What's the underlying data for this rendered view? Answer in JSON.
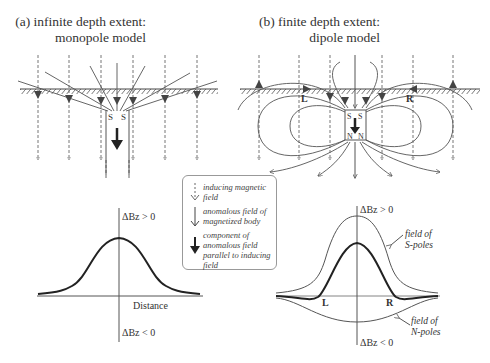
{
  "panel_a": {
    "title_line1": "(a) infinite depth extent:",
    "title_line2": "monopole model",
    "pole_labels": [
      "S",
      "S"
    ],
    "graph": {
      "y_pos_label": "ΔBz > 0",
      "y_neg_label": "ΔBz < 0",
      "x_label": "Distance"
    }
  },
  "panel_b": {
    "title_line1": "(b) finite depth extent:",
    "title_line2": "dipole model",
    "top_pole_labels": [
      "S",
      "S"
    ],
    "bottom_pole_labels": [
      "N",
      "N"
    ],
    "point_left": "L",
    "point_right": "R",
    "graph": {
      "y_pos_label": "ΔBz > 0",
      "y_neg_label": "ΔBz < 0",
      "s_field_label_1": "field of",
      "s_field_label_2": "S-poles",
      "n_field_label_1": "field of",
      "n_field_label_2": "N-poles",
      "point_left": "L",
      "point_right": "R"
    }
  },
  "legend": {
    "items": [
      {
        "icon": "dashed-arrow-icon",
        "text": "inducing magnetic field"
      },
      {
        "icon": "thin-arrow-icon",
        "text": "anomalous field of magnetized body"
      },
      {
        "icon": "bold-triangle-arrow-icon",
        "text": "component of anomalous field parallel to inducing field"
      }
    ]
  }
}
